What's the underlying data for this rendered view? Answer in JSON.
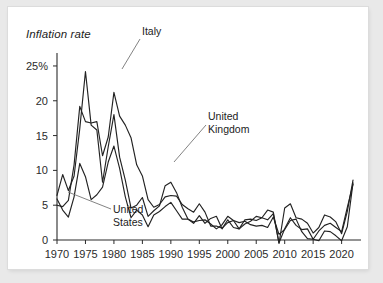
{
  "card": {
    "background": "#ffffff",
    "page_background": "#e9e9e9"
  },
  "chart_data": {
    "type": "line",
    "title": "Inflation rate",
    "xlabel": "",
    "ylabel": "",
    "grid": false,
    "legend_position": "inline-annotations",
    "xlim": [
      1970,
      2022
    ],
    "ylim": [
      -1,
      26
    ],
    "ytick_labels": [
      "0",
      "5",
      "10",
      "15",
      "20",
      "25%"
    ],
    "yticks": [
      0,
      5,
      10,
      15,
      20,
      25
    ],
    "xtick_labels": [
      "1970",
      "1975",
      "1980",
      "1985",
      "1990",
      "1995",
      "2000",
      "2005",
      "2010",
      "2015",
      "2020"
    ],
    "xticks": [
      1970,
      1975,
      1980,
      1985,
      1990,
      1995,
      2000,
      2005,
      2010,
      2015,
      2020
    ],
    "x": [
      1970,
      1971,
      1972,
      1973,
      1974,
      1975,
      1976,
      1977,
      1978,
      1979,
      1980,
      1981,
      1982,
      1983,
      1984,
      1985,
      1986,
      1987,
      1988,
      1989,
      1990,
      1991,
      1992,
      1993,
      1994,
      1995,
      1996,
      1997,
      1998,
      1999,
      2000,
      2001,
      2002,
      2003,
      2004,
      2005,
      2006,
      2007,
      2008,
      2009,
      2010,
      2011,
      2012,
      2013,
      2014,
      2015,
      2016,
      2017,
      2018,
      2019,
      2020,
      2021,
      2022
    ],
    "series": [
      {
        "name": "Italy",
        "color": "#222222",
        "values": [
          5.0,
          4.8,
          5.7,
          10.8,
          19.2,
          17.0,
          16.8,
          17.0,
          12.1,
          14.8,
          21.2,
          17.8,
          16.5,
          14.7,
          10.8,
          9.2,
          5.8,
          4.7,
          5.1,
          6.2,
          6.4,
          6.3,
          5.1,
          4.5,
          4.0,
          5.2,
          4.0,
          2.0,
          2.0,
          1.7,
          2.5,
          2.8,
          2.5,
          2.7,
          2.2,
          2.0,
          2.1,
          1.8,
          3.3,
          0.8,
          1.5,
          2.8,
          3.0,
          1.2,
          0.2,
          0.1,
          -0.1,
          1.3,
          1.2,
          0.6,
          -0.1,
          1.9,
          8.2
        ],
        "annotation": "Italy"
      },
      {
        "name": "United Kingdom",
        "color": "#222222",
        "values": [
          6.4,
          9.4,
          7.1,
          9.2,
          16.0,
          24.2,
          16.5,
          15.8,
          8.3,
          13.4,
          18.0,
          11.9,
          8.6,
          4.6,
          5.0,
          6.1,
          3.4,
          4.2,
          4.9,
          7.8,
          8.3,
          6.8,
          4.7,
          3.0,
          2.4,
          3.5,
          2.4,
          3.1,
          3.4,
          1.6,
          2.9,
          1.8,
          1.6,
          2.9,
          3.0,
          2.8,
          3.2,
          4.3,
          4.0,
          -0.5,
          4.6,
          5.2,
          3.2,
          3.0,
          2.4,
          1.0,
          1.8,
          3.6,
          3.3,
          2.6,
          0.9,
          4.1,
          8.6
        ],
        "annotation": "United Kingdom"
      },
      {
        "name": "United States",
        "color": "#222222",
        "values": [
          5.9,
          4.3,
          3.3,
          6.2,
          11.0,
          9.1,
          5.8,
          6.5,
          7.6,
          11.2,
          13.5,
          10.3,
          6.2,
          3.2,
          4.3,
          3.6,
          1.9,
          3.6,
          4.1,
          4.8,
          5.4,
          4.2,
          3.0,
          3.0,
          2.6,
          2.8,
          2.9,
          2.3,
          1.6,
          2.2,
          3.4,
          2.8,
          1.6,
          2.3,
          2.7,
          3.4,
          3.2,
          2.9,
          3.8,
          -0.4,
          1.6,
          3.2,
          2.1,
          1.5,
          1.6,
          0.1,
          1.3,
          2.1,
          2.4,
          1.8,
          1.2,
          4.7,
          8.0
        ],
        "annotation": "United States"
      }
    ],
    "annotations": [
      {
        "text": "Italy",
        "lines": [
          "Italy"
        ]
      },
      {
        "text": "United Kingdom",
        "lines": [
          "United",
          "Kingdom"
        ]
      },
      {
        "text": "United States",
        "lines": [
          "United",
          "States"
        ]
      }
    ]
  }
}
